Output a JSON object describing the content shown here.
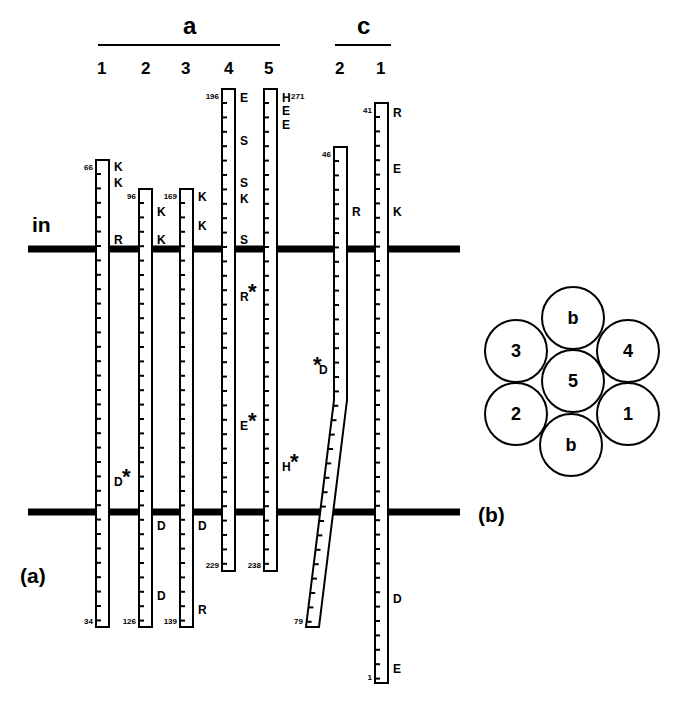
{
  "membrane": {
    "in_label": "in"
  },
  "panel_a": {
    "label": "(a)",
    "groups": [
      {
        "name": "a",
        "helix_numbers": [
          "1",
          "2",
          "3",
          "4",
          "5"
        ]
      },
      {
        "name": "c",
        "helix_numbers": [
          "2",
          "1"
        ]
      }
    ],
    "helices": [
      {
        "id": "a1",
        "top_residue": "66",
        "bottom_residue": "34",
        "residues": [
          [
            "K",
            "top"
          ],
          [
            "K",
            "top2"
          ],
          [
            "R",
            "in"
          ],
          [
            "D",
            "low",
            true
          ]
        ]
      },
      {
        "id": "a2",
        "top_residue": "96",
        "bottom_residue": "126",
        "residues": [
          [
            "K",
            "top"
          ],
          [
            "K",
            "in"
          ],
          [
            "D",
            "out"
          ],
          [
            "D",
            "low"
          ]
        ]
      },
      {
        "id": "a3",
        "top_residue": "169",
        "bottom_residue": "139",
        "residues": [
          [
            "K",
            "top"
          ],
          [
            "K",
            "top2"
          ],
          [
            "D",
            "out"
          ],
          [
            "R",
            "low"
          ]
        ]
      },
      {
        "id": "a4",
        "top_residue": "196",
        "bottom_residue": "229",
        "residues": [
          [
            "E",
            "top"
          ],
          [
            "S",
            "top2"
          ],
          [
            "S",
            "top3"
          ],
          [
            "K",
            "top4"
          ],
          [
            "S",
            "in"
          ],
          [
            "R",
            "mid1",
            true
          ],
          [
            "E",
            "mid2",
            true
          ]
        ]
      },
      {
        "id": "a5",
        "top_residue": "271",
        "bottom_residue": "238",
        "residues": [
          [
            "H",
            "top"
          ],
          [
            "E",
            "top2"
          ],
          [
            "E",
            "top3"
          ],
          [
            "H",
            "mid3",
            true
          ]
        ]
      },
      {
        "id": "c2",
        "top_residue": "46",
        "bottom_residue": "79",
        "residues": [
          [
            "R",
            "top"
          ],
          [
            "D",
            "mid",
            true
          ]
        ]
      },
      {
        "id": "c1",
        "top_residue": "41",
        "bottom_residue": "1",
        "residues": [
          [
            "R",
            "top"
          ],
          [
            "E",
            "top2"
          ],
          [
            "K",
            "top3"
          ],
          [
            "D",
            "low"
          ],
          [
            "E",
            "low2"
          ]
        ]
      }
    ]
  },
  "panel_b": {
    "label": "(b)",
    "circles": [
      "b",
      "3",
      "4",
      "5",
      "2",
      "1",
      "b"
    ]
  }
}
